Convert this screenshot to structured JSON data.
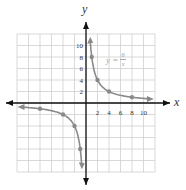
{
  "chart_data": {
    "type": "line",
    "title": "",
    "equation": {
      "lhs": "y =",
      "numerator": "8",
      "denominator": "x"
    },
    "xlabel": "x",
    "ylabel": "y",
    "xlim": [
      -12,
      12
    ],
    "ylim": [
      -12,
      12
    ],
    "grid": true,
    "x_ticks": [
      2,
      4,
      6,
      8,
      10
    ],
    "y_ticks": [
      2,
      4,
      6,
      8,
      10
    ],
    "series": [
      {
        "name": "y = 8/x",
        "points": [
          [
            1,
            8
          ],
          [
            2,
            4
          ],
          [
            4,
            2
          ],
          [
            8,
            1
          ],
          [
            -1,
            -8
          ],
          [
            -2,
            -4
          ],
          [
            -4,
            -2
          ],
          [
            -8,
            -1
          ]
        ]
      }
    ],
    "colors": {
      "curve": "#8a8a8a",
      "axis": "#111111",
      "grid": "#cfcfcf"
    }
  }
}
